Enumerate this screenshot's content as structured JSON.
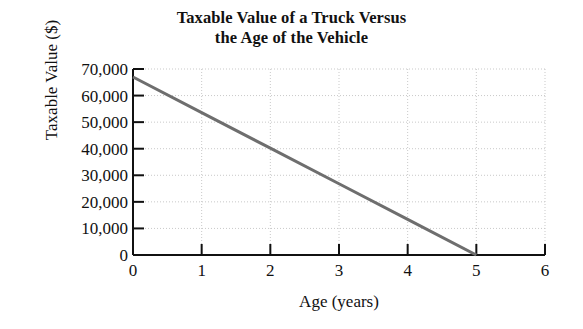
{
  "chart_data": {
    "type": "line",
    "title": "Taxable Value of a Truck Versus the Age of the Vehicle",
    "title_lines": [
      "Taxable Value of a Truck Versus",
      "the Age of the Vehicle"
    ],
    "xlabel": "Age (years)",
    "ylabel": "Taxable Value ($)",
    "xlim": [
      0,
      6
    ],
    "ylim": [
      0,
      70000
    ],
    "xticks": [
      0,
      1,
      2,
      3,
      4,
      5,
      6
    ],
    "xtick_labels": [
      "0",
      "1",
      "2",
      "3",
      "4",
      "5",
      "6"
    ],
    "yticks": [
      0,
      10000,
      20000,
      30000,
      40000,
      50000,
      60000,
      70000
    ],
    "ytick_labels": [
      "0",
      "10,000",
      "20,000",
      "30,000",
      "40,000",
      "50,000",
      "60,000",
      "70,000"
    ],
    "grid": true,
    "grid_style": "dotted",
    "legend": false,
    "series": [
      {
        "name": "Taxable Value",
        "color": "#6e6e6e",
        "line_width": 3,
        "x": [
          0,
          1,
          2,
          3,
          4,
          5
        ],
        "values": [
          67000,
          53600,
          40200,
          26800,
          13400,
          0
        ]
      }
    ],
    "annotations": []
  },
  "axis_colors": {
    "spine": "#111111",
    "grid": "#c9c9c9",
    "line": "#6e6e6e",
    "background": "#ffffff"
  }
}
